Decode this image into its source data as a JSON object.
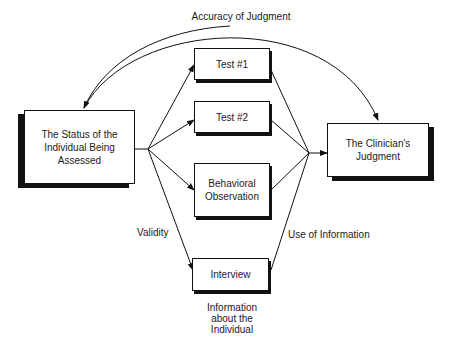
{
  "diagram": {
    "arc_label": "Accuracy of Judgment",
    "nodes": {
      "status": {
        "line1": "The Status of the",
        "line2": "Individual Being",
        "line3": "Assessed"
      },
      "test1": {
        "label": "Test #1"
      },
      "test2": {
        "label": "Test #2"
      },
      "behavioral": {
        "line1": "Behavioral",
        "line2": "Observation"
      },
      "interview": {
        "label": "Interview"
      },
      "judgment": {
        "line1": "The Clinician's",
        "line2": "Judgment"
      }
    },
    "edge_labels": {
      "validity": "Validity",
      "use_of_information": "Use of Information"
    },
    "caption": {
      "line1": "Information",
      "line2": "about the",
      "line3": "Individual"
    }
  }
}
